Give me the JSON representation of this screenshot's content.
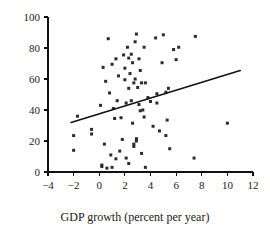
{
  "chart_data": {
    "type": "scatter",
    "title": "",
    "subtitle": "",
    "xlabel": "GDP growth (percent per year)",
    "ylabel": "",
    "xlim": [
      -4,
      12
    ],
    "ylim": [
      0,
      100
    ],
    "xticks": [
      -4,
      -2,
      0,
      2,
      4,
      6,
      8,
      10,
      12
    ],
    "yticks": [
      0,
      20,
      40,
      60,
      80,
      100
    ],
    "xtick_labels": [
      "−4",
      "−2",
      "0",
      "2",
      "4",
      "6",
      "8",
      "10",
      "12"
    ],
    "ytick_labels": [
      "0",
      "20",
      "40",
      "60",
      "80",
      "100"
    ],
    "grid": false,
    "legend": null,
    "marker": "square",
    "marker_color": "#2b2b2b",
    "marker_size": 3,
    "points": [
      [
        -2.0,
        23.5
      ],
      [
        -2.0,
        14.0
      ],
      [
        -1.7,
        36.0
      ],
      [
        -0.6,
        27.5
      ],
      [
        -0.6,
        24.5
      ],
      [
        0.1,
        43.0
      ],
      [
        0.2,
        4.5
      ],
      [
        0.2,
        3.5
      ],
      [
        0.3,
        67.5
      ],
      [
        0.4,
        18.0
      ],
      [
        0.5,
        58.5
      ],
      [
        0.6,
        2.5
      ],
      [
        0.7,
        86.0
      ],
      [
        0.8,
        51.0
      ],
      [
        0.9,
        11.0
      ],
      [
        1.0,
        69.5
      ],
      [
        1.0,
        3.0
      ],
      [
        1.1,
        41.0
      ],
      [
        1.2,
        34.5
      ],
      [
        1.3,
        73.0
      ],
      [
        1.3,
        8.5
      ],
      [
        1.4,
        46.0
      ],
      [
        1.5,
        62.0
      ],
      [
        1.6,
        13.5
      ],
      [
        1.7,
        35.0
      ],
      [
        1.8,
        21.0
      ],
      [
        1.9,
        75.5
      ],
      [
        2.0,
        67.0
      ],
      [
        2.0,
        59.5
      ],
      [
        2.1,
        44.5
      ],
      [
        2.1,
        9.0
      ],
      [
        2.2,
        80.5
      ],
      [
        2.3,
        73.5
      ],
      [
        2.3,
        54.0
      ],
      [
        2.3,
        5.5
      ],
      [
        2.4,
        63.5
      ],
      [
        2.5,
        76.0
      ],
      [
        2.5,
        46.0
      ],
      [
        2.6,
        70.5
      ],
      [
        2.6,
        31.5
      ],
      [
        2.7,
        57.5
      ],
      [
        2.7,
        18.0
      ],
      [
        2.7,
        16.5
      ],
      [
        2.8,
        84.0
      ],
      [
        2.8,
        60.0
      ],
      [
        2.9,
        89.0
      ],
      [
        2.9,
        21.5
      ],
      [
        2.9,
        20.0
      ],
      [
        3.0,
        54.5
      ],
      [
        3.1,
        73.0
      ],
      [
        3.1,
        43.5
      ],
      [
        3.2,
        65.5
      ],
      [
        3.2,
        39.5
      ],
      [
        3.3,
        57.5
      ],
      [
        3.3,
        12.0
      ],
      [
        3.4,
        40.0
      ],
      [
        3.5,
        80.5
      ],
      [
        3.5,
        35.5
      ],
      [
        3.6,
        57.5
      ],
      [
        3.6,
        3.0
      ],
      [
        3.8,
        48.0
      ],
      [
        4.0,
        45.5
      ],
      [
        4.2,
        29.5
      ],
      [
        4.4,
        86.5
      ],
      [
        4.5,
        50.5
      ],
      [
        4.5,
        44.5
      ],
      [
        4.7,
        26.5
      ],
      [
        4.9,
        70.5
      ],
      [
        5.0,
        88.5
      ],
      [
        5.2,
        51.5
      ],
      [
        5.2,
        23.5
      ],
      [
        5.3,
        33.5
      ],
      [
        5.4,
        54.0
      ],
      [
        5.5,
        15.0
      ],
      [
        5.8,
        79.0
      ],
      [
        6.0,
        72.5
      ],
      [
        6.2,
        80.5
      ],
      [
        7.4,
        9.0
      ],
      [
        7.5,
        87.5
      ],
      [
        10.0,
        31.5
      ]
    ],
    "trend_line": {
      "type": "linear_fit",
      "x_start": -2.2,
      "y_start": 32.0,
      "x_end": 11.0,
      "y_end": 65.5
    }
  },
  "axes": {
    "x_axis_name": "x-axis",
    "y_axis_name": "y-axis"
  }
}
